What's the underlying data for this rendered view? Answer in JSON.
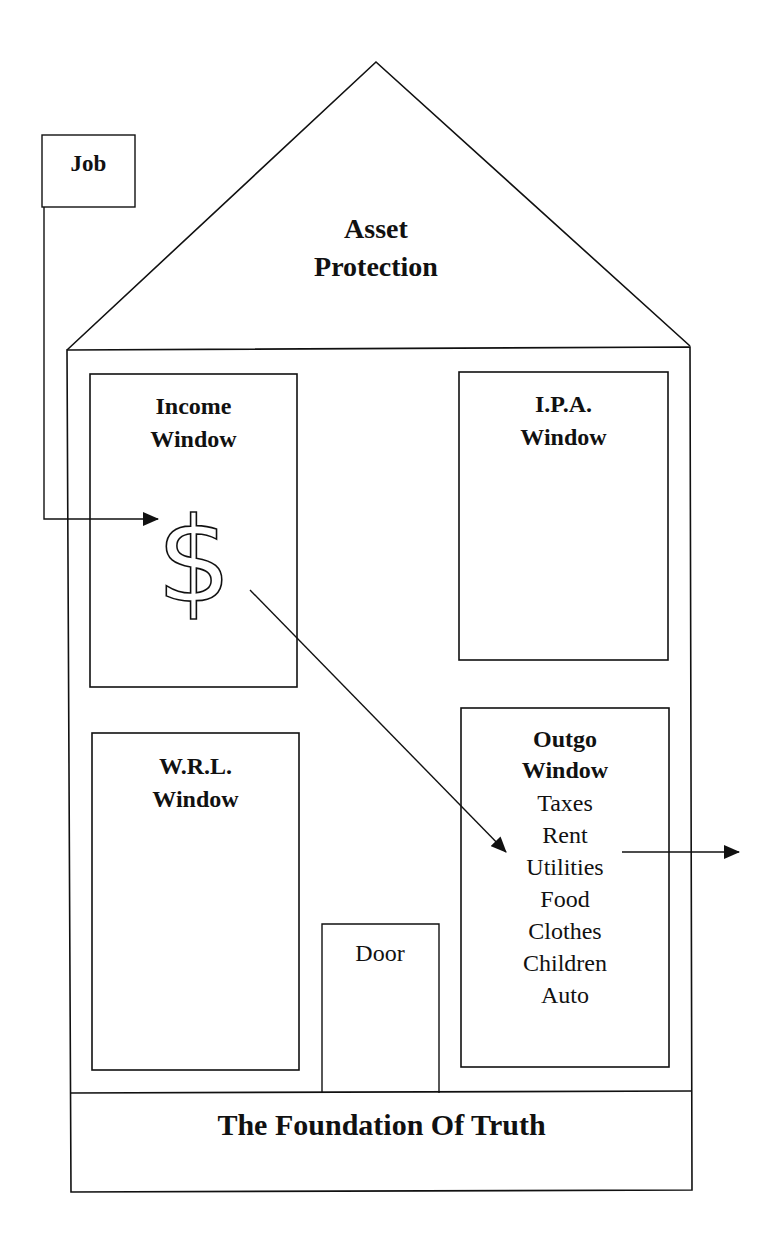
{
  "diagram": {
    "roof": {
      "title_line1": "Asset",
      "title_line2": "Protection"
    },
    "job": {
      "label": "Job"
    },
    "windows": {
      "income": {
        "line1": "Income",
        "line2": "Window",
        "symbol": "$"
      },
      "ipa": {
        "line1": "I.P.A.",
        "line2": "Window"
      },
      "wrl": {
        "line1": "W.R.L.",
        "line2": "Window"
      },
      "outgo": {
        "line1": "Outgo",
        "line2": "Window",
        "items": [
          "Taxes",
          "Rent",
          "Utilities",
          "Food",
          "Clothes",
          "Children",
          "Auto"
        ]
      }
    },
    "door": {
      "label": "Door"
    },
    "foundation": {
      "label": "The Foundation Of Truth"
    },
    "colors": {
      "stroke": "#111111",
      "background": "#ffffff"
    }
  }
}
